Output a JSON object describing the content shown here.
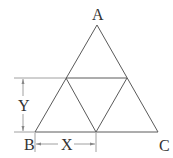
{
  "diagram": {
    "type": "geometric-figure",
    "vertices": {
      "A": {
        "label": "A",
        "x": 97,
        "y": 25
      },
      "B": {
        "label": "B",
        "x": 35,
        "y": 132
      },
      "C": {
        "label": "C",
        "x": 158,
        "y": 132
      }
    },
    "midpoints": {
      "AB": {
        "x": 66,
        "y": 78
      },
      "AC": {
        "x": 127,
        "y": 78
      },
      "BC": {
        "x": 96,
        "y": 132
      }
    },
    "dimensions": {
      "X": {
        "label": "X",
        "meaning": "horizontal distance from B to midpoint of BC"
      },
      "Y": {
        "label": "Y",
        "meaning": "vertical height from base BC to midline"
      }
    },
    "colors": {
      "line": "#5a5a5a",
      "dimension": "#888888",
      "text": "#333333"
    }
  }
}
